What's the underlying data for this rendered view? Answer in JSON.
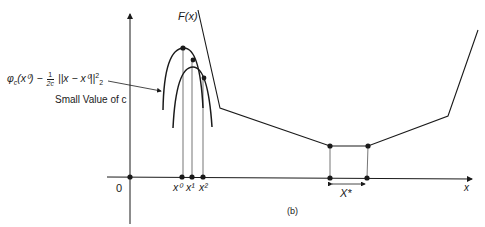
{
  "figure": {
    "caption": "(b)",
    "curve_label": "F(x)",
    "formula_label": {
      "phi": "φ",
      "phi_sub": "c",
      "arg": "(x⁰) −",
      "frac_num": "1",
      "frac_den": "2c",
      "norm": "||x − x⁰||",
      "norm_sub": "2",
      "norm_sup": "2"
    },
    "note": "Small Value of c",
    "origin_label": "0",
    "x_axis_label": "x",
    "iterate_labels": [
      "x⁰",
      "x¹",
      "x²"
    ],
    "solution_set_label": "X*",
    "colors": {
      "line": "#1a1a1a",
      "background": "#ffffff"
    }
  }
}
